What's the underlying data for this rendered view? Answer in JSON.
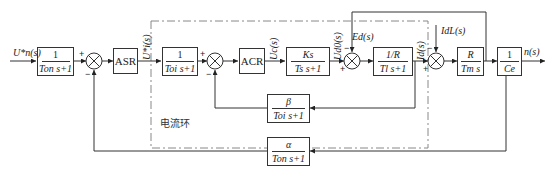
{
  "diagram": {
    "type": "block-diagram",
    "title": "",
    "input_label": "U*n(s)",
    "output_label": "n(s)",
    "inner_loop_caption": "电流环",
    "blocks": [
      {
        "id": "input-filter",
        "num": "1",
        "den": "Ton s+1"
      },
      {
        "id": "asr",
        "label": "ASR"
      },
      {
        "id": "current-filter",
        "num": "1",
        "den": "Toi s+1"
      },
      {
        "id": "acr",
        "label": "ACR"
      },
      {
        "id": "converter",
        "num": "Ks",
        "den": "Ts s+1"
      },
      {
        "id": "armature",
        "num": "1/R",
        "den": "Tl s+1"
      },
      {
        "id": "mechanical",
        "num": "R",
        "den": "Tm s"
      },
      {
        "id": "back-emf",
        "num": "1",
        "den": "Ce"
      },
      {
        "id": "current-feedback",
        "num": "β",
        "den": "Toi s+1"
      },
      {
        "id": "speed-feedback",
        "num": "α",
        "den": "Ton s+1"
      }
    ],
    "signals": {
      "ui_star": "U*i(s)",
      "uc": "Uc(s)",
      "ud0": "Ud0(s)",
      "ed": "Ed(s)",
      "id": "Id(s)",
      "idl": "IdL(s)"
    },
    "signs": {
      "sum1": [
        "+",
        "−"
      ],
      "sum2": [
        "+",
        "−"
      ],
      "sum3": [
        "+",
        "−"
      ],
      "sum4": [
        "+",
        "−"
      ]
    }
  }
}
